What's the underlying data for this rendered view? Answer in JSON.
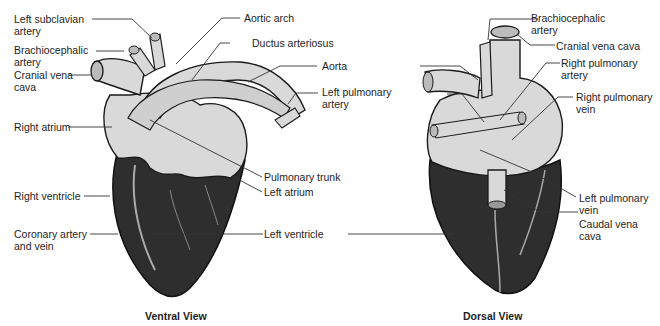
{
  "colors": {
    "light_tissue": "#d9d9d9",
    "dark_tissue": "#2e2e2e",
    "outline": "#1a1a1a",
    "leader": "#333333"
  },
  "views": [
    {
      "id": "ventral",
      "caption": "Ventral View",
      "labels": [
        {
          "id": "left-subclavian-artery",
          "text": "Left subclavian\nartery"
        },
        {
          "id": "brachiocephalic-artery",
          "text": "Brachiocephalic\nartery"
        },
        {
          "id": "cranial-vena-cava",
          "text": "Cranial vena\ncava"
        },
        {
          "id": "right-atrium",
          "text": "Right atrium"
        },
        {
          "id": "right-ventricle",
          "text": "Right ventricle"
        },
        {
          "id": "coronary-artery-and-vein",
          "text": "Coronary artery\nand vein"
        },
        {
          "id": "aortic-arch",
          "text": "Aortic arch"
        },
        {
          "id": "ductus-arteriosus",
          "text": "Ductus arteriosus"
        },
        {
          "id": "aorta",
          "text": "Aorta"
        },
        {
          "id": "left-pulmonary-artery",
          "text": "Left pulmonary\nartery"
        },
        {
          "id": "pulmonary-trunk",
          "text": "Pulmonary trunk"
        },
        {
          "id": "left-atrium",
          "text": "Left atrium"
        },
        {
          "id": "left-ventricle",
          "text": "Left ventricle"
        }
      ]
    },
    {
      "id": "dorsal",
      "caption": "Dorsal View",
      "labels": [
        {
          "id": "brachiocephalic-artery",
          "text": "Brachiocephalic\nartery"
        },
        {
          "id": "cranial-vena-cava",
          "text": "Cranial vena cava"
        },
        {
          "id": "right-pulmonary-artery",
          "text": "Right pulmonary\nartery"
        },
        {
          "id": "right-pulmonary-vein",
          "text": "Right pulmonary\nvein"
        },
        {
          "id": "left-pulmonary-vein",
          "text": "Left pulmonary\nvein"
        },
        {
          "id": "caudal-vena-cava",
          "text": "Caudal vena\ncava"
        }
      ]
    }
  ]
}
